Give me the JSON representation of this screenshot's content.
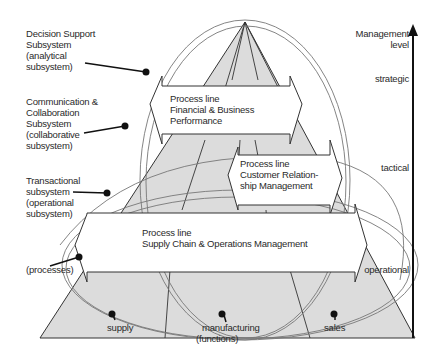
{
  "subsystems": {
    "decision_support": [
      "Decision Support",
      "Subsystem",
      "(analytical",
      "subsystem)"
    ],
    "communication": [
      "Communication &",
      "Collaboration",
      "Subsystem",
      "(collaborative",
      "subsystem)"
    ],
    "transactional": [
      "Transactional",
      "subsystem",
      "(operational",
      "subsystem)"
    ],
    "processes": "(processes)"
  },
  "axis": {
    "title": [
      "Management",
      "level"
    ],
    "levels": [
      "strategic",
      "tactical",
      "operational"
    ]
  },
  "process_lines": [
    {
      "title": "Process line",
      "name": [
        "Financial & Business",
        "Performance"
      ]
    },
    {
      "title": "Process line",
      "name": [
        "Customer Relation-",
        "ship Management"
      ]
    },
    {
      "title": "Process line",
      "name": [
        "Supply Chain & Operations Management"
      ]
    }
  ],
  "functions": {
    "items": [
      "supply",
      "manufacturing",
      "sales"
    ],
    "caption": "(functions)"
  },
  "colors": {
    "pyramid_fill": "#dcdcdc",
    "line": "#333333",
    "ellipse": "#777777",
    "arrow_fill": "#ffffff"
  }
}
